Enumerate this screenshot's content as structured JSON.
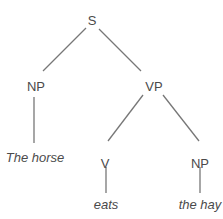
{
  "tree": {
    "nodes": [
      {
        "id": "S",
        "label": "S",
        "x": 92,
        "y": 20,
        "leaf": false
      },
      {
        "id": "NP1",
        "label": "NP",
        "x": 36,
        "y": 86,
        "leaf": false
      },
      {
        "id": "VP",
        "label": "VP",
        "x": 154,
        "y": 86,
        "leaf": false
      },
      {
        "id": "W1",
        "label": "The horse",
        "x": 35,
        "y": 157,
        "leaf": true
      },
      {
        "id": "V",
        "label": "V",
        "x": 105,
        "y": 163,
        "leaf": false
      },
      {
        "id": "NP2",
        "label": "NP",
        "x": 200,
        "y": 163,
        "leaf": false
      },
      {
        "id": "W2",
        "label": "eats",
        "x": 106,
        "y": 204,
        "leaf": true
      },
      {
        "id": "W3",
        "label": "the hay",
        "x": 200,
        "y": 204,
        "leaf": true
      }
    ],
    "edges": [
      {
        "from": "S",
        "to": "NP1",
        "x1": 86,
        "y1": 28,
        "x2": 43,
        "y2": 71
      },
      {
        "from": "S",
        "to": "VP",
        "x1": 99,
        "y1": 29,
        "x2": 141,
        "y2": 71
      },
      {
        "from": "NP1",
        "to": "W1",
        "x1": 34,
        "y1": 97,
        "x2": 34,
        "y2": 143
      },
      {
        "from": "VP",
        "to": "V",
        "x1": 143,
        "y1": 95,
        "x2": 108,
        "y2": 141
      },
      {
        "from": "VP",
        "to": "NP2",
        "x1": 163,
        "y1": 95,
        "x2": 199,
        "y2": 141
      },
      {
        "from": "V",
        "to": "W2",
        "x1": 106,
        "y1": 167,
        "x2": 106,
        "y2": 193
      },
      {
        "from": "NP2",
        "to": "W3",
        "x1": 200,
        "y1": 167,
        "x2": 200,
        "y2": 193
      }
    ],
    "line_color": "#777777",
    "text_color": "#4a4a4a"
  }
}
